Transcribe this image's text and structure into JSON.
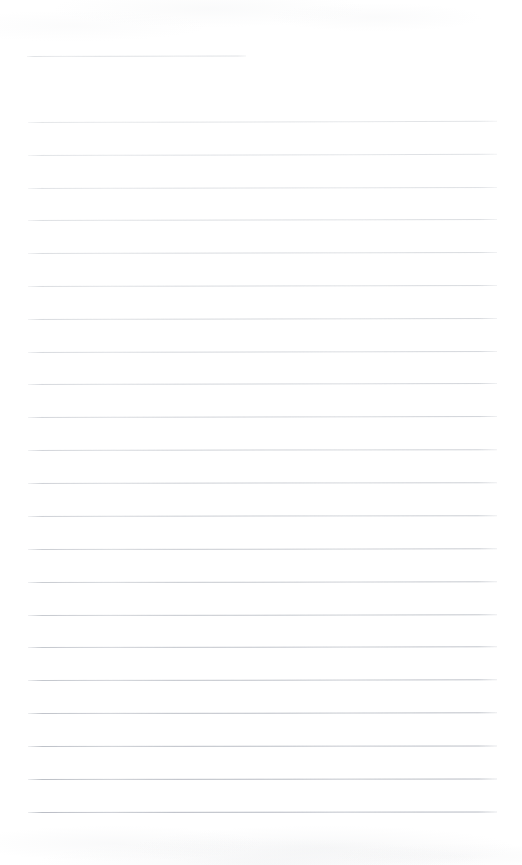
{
  "document": {
    "kind": "lined-notebook-page",
    "type": "scanned-blank-ruled-sheet",
    "page_width": 522,
    "page_height": 865,
    "page_background": "#ffffff",
    "rule_color": "#c5c9ce",
    "rule_color_lower": "#b7bcc3",
    "content_text": "",
    "has_handwriting": false,
    "has_printed_text": false
  },
  "layout": {
    "left_margin_x": 28,
    "right_margin_x": 496,
    "header_rule": {
      "label": "header-blank-rule",
      "x_start": 27,
      "x_end": 246,
      "y": 56,
      "width": 219
    },
    "body_rules": {
      "first_y": 122,
      "last_y": 812,
      "spacing": 32.85,
      "count": 22,
      "x_start": 28,
      "x_end": 496,
      "width": 468
    }
  },
  "rules": [
    {
      "id": "rule-header",
      "y": 56,
      "x": 27,
      "w": 219,
      "opacity": 0.58,
      "tilt": -0.1,
      "ink": "#c9cdd2"
    },
    {
      "id": "rule-01",
      "y": 122,
      "x": 28,
      "w": 469,
      "opacity": 0.52,
      "tilt": -0.14,
      "ink": "#c8ccd1"
    },
    {
      "id": "rule-02",
      "y": 155,
      "x": 28,
      "w": 469,
      "opacity": 0.55,
      "tilt": -0.14,
      "ink": "#c6cad0"
    },
    {
      "id": "rule-03",
      "y": 188,
      "x": 28,
      "w": 469,
      "opacity": 0.56,
      "tilt": -0.13,
      "ink": "#c6cad0"
    },
    {
      "id": "rule-04",
      "y": 220,
      "x": 28,
      "w": 469,
      "opacity": 0.6,
      "tilt": -0.13,
      "ink": "#c4c8ce"
    },
    {
      "id": "rule-05",
      "y": 253,
      "x": 28,
      "w": 469,
      "opacity": 0.62,
      "tilt": -0.12,
      "ink": "#c3c7cd"
    },
    {
      "id": "rule-06",
      "y": 286,
      "x": 28,
      "w": 469,
      "opacity": 0.63,
      "tilt": -0.12,
      "ink": "#c2c6cc"
    },
    {
      "id": "rule-07",
      "y": 319,
      "x": 28,
      "w": 469,
      "opacity": 0.65,
      "tilt": -0.12,
      "ink": "#c1c5cb"
    },
    {
      "id": "rule-08",
      "y": 352,
      "x": 28,
      "w": 469,
      "opacity": 0.66,
      "tilt": -0.11,
      "ink": "#c0c4cb"
    },
    {
      "id": "rule-09",
      "y": 384,
      "x": 28,
      "w": 469,
      "opacity": 0.68,
      "tilt": -0.11,
      "ink": "#bfc3ca"
    },
    {
      "id": "rule-10",
      "y": 417,
      "x": 28,
      "w": 469,
      "opacity": 0.7,
      "tilt": -0.11,
      "ink": "#bec2c9"
    },
    {
      "id": "rule-11",
      "y": 450,
      "x": 28,
      "w": 469,
      "opacity": 0.72,
      "tilt": -0.1,
      "ink": "#bdc1c8"
    },
    {
      "id": "rule-12",
      "y": 483,
      "x": 28,
      "w": 469,
      "opacity": 0.74,
      "tilt": -0.1,
      "ink": "#bcc0c7"
    },
    {
      "id": "rule-13",
      "y": 516,
      "x": 28,
      "w": 469,
      "opacity": 0.76,
      "tilt": -0.1,
      "ink": "#bbbfc6"
    },
    {
      "id": "rule-14",
      "y": 549,
      "x": 28,
      "w": 469,
      "opacity": 0.78,
      "tilt": -0.09,
      "ink": "#babec5"
    },
    {
      "id": "rule-15",
      "y": 582,
      "x": 28,
      "w": 469,
      "opacity": 0.8,
      "tilt": -0.09,
      "ink": "#b9bdc4"
    },
    {
      "id": "rule-16",
      "y": 615,
      "x": 28,
      "w": 469,
      "opacity": 0.82,
      "tilt": -0.09,
      "ink": "#b8bcc3"
    },
    {
      "id": "rule-17",
      "y": 647,
      "x": 28,
      "w": 469,
      "opacity": 0.84,
      "tilt": -0.08,
      "ink": "#b7bbc3"
    },
    {
      "id": "rule-18",
      "y": 680,
      "x": 28,
      "w": 469,
      "opacity": 0.86,
      "tilt": -0.08,
      "ink": "#b6bac2"
    },
    {
      "id": "rule-19",
      "y": 713,
      "x": 28,
      "w": 469,
      "opacity": 0.88,
      "tilt": -0.08,
      "ink": "#b5b9c1"
    },
    {
      "id": "rule-20",
      "y": 746,
      "x": 28,
      "w": 469,
      "opacity": 0.9,
      "tilt": -0.07,
      "ink": "#b4b8c0"
    },
    {
      "id": "rule-21",
      "y": 779,
      "x": 28,
      "w": 469,
      "opacity": 0.92,
      "tilt": -0.07,
      "ink": "#b3b7bf"
    },
    {
      "id": "rule-22",
      "y": 812,
      "x": 28,
      "w": 469,
      "opacity": 0.94,
      "tilt": -0.06,
      "ink": "#b2b6bf"
    }
  ]
}
